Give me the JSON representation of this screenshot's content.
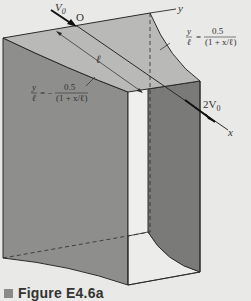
{
  "figure": {
    "caption": "Figure E4.6a",
    "labels": {
      "inlet_velocity": "V",
      "inlet_velocity_sub": "0",
      "origin": "O",
      "y_axis": "y",
      "x_axis": "x",
      "length": "ℓ",
      "outlet_velocity": "2V",
      "outlet_velocity_sub": "0"
    },
    "equations": {
      "upper_wall": {
        "lhs_num": "y",
        "lhs_den": "ℓ",
        "eq": "=",
        "rhs_num": "0.5",
        "rhs_den": "(1 + x/ℓ)"
      },
      "lower_wall": {
        "lhs_num": "y",
        "lhs_den": "ℓ",
        "eq": "= −",
        "rhs_num": "0.5",
        "rhs_den": "(1 + x/ℓ)"
      }
    },
    "colors": {
      "background": "#e9e9e7",
      "top_face": "#b9b9b7",
      "left_wall": "#8e8e8c",
      "right_wall": "#7a7a78",
      "inner_panel": "#efefed",
      "lines": "#2a2a2a"
    }
  }
}
